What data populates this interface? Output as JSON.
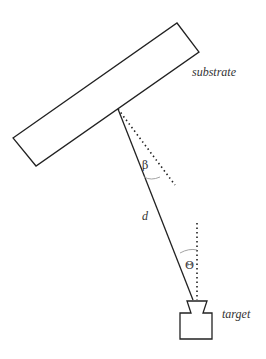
{
  "diagram": {
    "type": "geometry-schematic",
    "labels": {
      "substrate": "substrate",
      "target": "target",
      "distance": "d",
      "beta": "β",
      "theta": "Θ"
    },
    "elements": {
      "substrate": {
        "shape": "rotated-rectangle",
        "corners": [
          [
            13,
            138
          ],
          [
            177,
            23
          ],
          [
            199,
            52
          ],
          [
            36,
            166
          ]
        ]
      },
      "source_line": {
        "style": "solid",
        "from": [
          118,
          109
        ],
        "to": [
          193,
          300
        ]
      },
      "substrate_normal": {
        "style": "dotted",
        "from": [
          118,
          109
        ],
        "to": [
          175,
          185
        ]
      },
      "target_vertical": {
        "style": "dotted",
        "from": [
          197,
          223
        ],
        "to": [
          197,
          300
        ]
      },
      "target": {
        "shape": "nozzle-block"
      }
    },
    "colors": {
      "stroke": "#222222",
      "arc": "#999999",
      "text": "#333333",
      "background": "#ffffff"
    }
  }
}
